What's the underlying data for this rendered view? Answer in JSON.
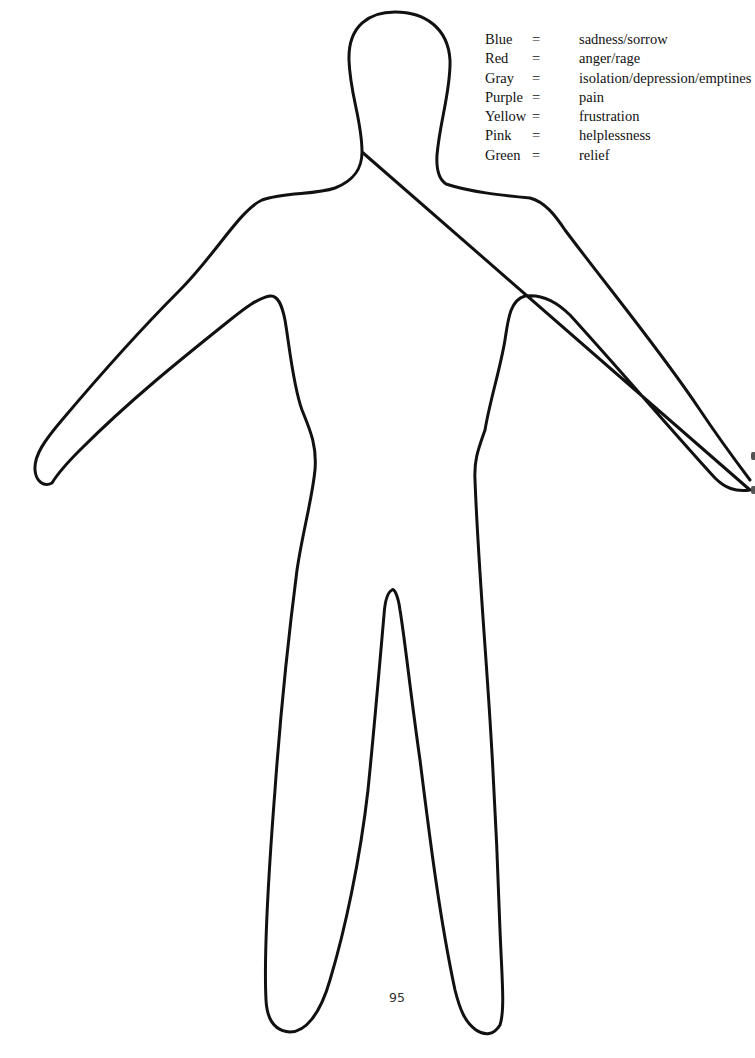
{
  "document": {
    "type": "body outline worksheet",
    "page_number": "95",
    "colors": {
      "outline": "#111111",
      "background": "#ffffff",
      "text": "#111111"
    }
  },
  "legend": {
    "rows": [
      {
        "color": "Blue",
        "equals": "=",
        "meaning": "sadness/sorrow"
      },
      {
        "color": "Red",
        "equals": "=",
        "meaning": "anger/rage"
      },
      {
        "color": "Gray",
        "equals": "=",
        "meaning": "isolation/depression/emptines"
      },
      {
        "color": "Purple",
        "equals": "=",
        "meaning": "pain"
      },
      {
        "color": "Yellow",
        "equals": "=",
        "meaning": "frustration"
      },
      {
        "color": "Pink",
        "equals": "=",
        "meaning": "helplessness"
      },
      {
        "color": "Green",
        "equals": "=",
        "meaning": "relief"
      }
    ]
  }
}
